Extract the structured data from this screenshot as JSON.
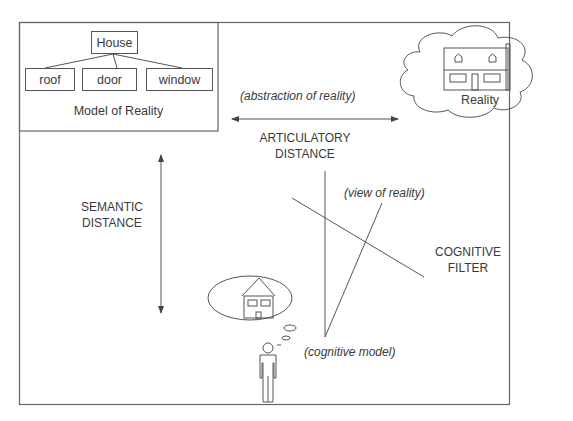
{
  "diagram": {
    "model_of_reality": {
      "title": "Model of Reality",
      "root": "House",
      "children": [
        "roof",
        "door",
        "window"
      ]
    },
    "reality": {
      "label": "Reality"
    },
    "articulatory": {
      "annotation": "(abstraction of reality)",
      "line1": "ARTICULATORY",
      "line2": "DISTANCE"
    },
    "semantic": {
      "line1": "SEMANTIC",
      "line2": "DISTANCE"
    },
    "cognitive_filter": {
      "line1": "COGNITIVE",
      "line2": "FILTER",
      "view_annotation": "(view of reality)",
      "model_annotation": "(cognitive model)"
    },
    "colors": {
      "stroke": "#555555",
      "text": "#3a3a3a",
      "background": "#ffffff"
    }
  }
}
